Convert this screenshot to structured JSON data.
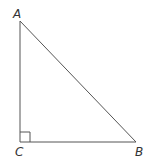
{
  "diagram": {
    "type": "right triangle",
    "vertices": [
      {
        "label": "A",
        "x": 20,
        "y": 21
      },
      {
        "label": "B",
        "x": 136,
        "y": 142
      },
      {
        "label": "C",
        "x": 20,
        "y": 142
      }
    ],
    "right_angle_at": "C",
    "line_color": "#555555",
    "label_color": "#333333"
  }
}
